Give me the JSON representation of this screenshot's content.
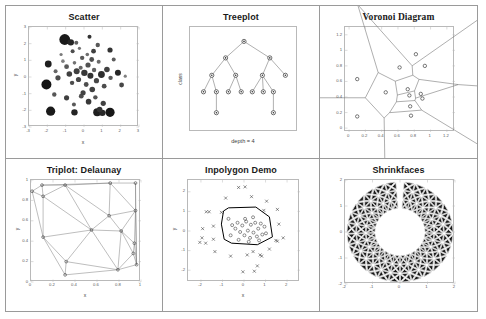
{
  "window": {
    "width": 486,
    "height": 319,
    "background": "#ffffff",
    "frame_color": "#9a9a9a"
  },
  "panels": [
    {
      "id": "scatter",
      "title": "Scatter",
      "title_font": "sans"
    },
    {
      "id": "treeplot",
      "title": "Treeplot",
      "title_font": "sans"
    },
    {
      "id": "voronoi",
      "title": "Voronoi Diagram",
      "title_font": "serif"
    },
    {
      "id": "triplot",
      "title": "Triplot: Delaunay",
      "title_font": "sans"
    },
    {
      "id": "inpolygon",
      "title": "Inpolygon Demo",
      "title_font": "sans"
    },
    {
      "id": "shrinkfaces",
      "title": "Shrinkfaces",
      "title_font": "sans"
    }
  ],
  "chart_data": [
    {
      "type": "scatter",
      "title": "Scatter",
      "xlabel": "x",
      "ylabel": "y",
      "xlim": [
        -3,
        3
      ],
      "ylim": [
        -3,
        3
      ],
      "xticks": [
        -3,
        -2,
        -1,
        0,
        1,
        2,
        3
      ],
      "yticks": [
        -3,
        -2,
        -1,
        0,
        1,
        2,
        3
      ],
      "xticklabels": [
        "-3",
        "-2",
        "-1",
        "0",
        "1",
        "2",
        "3"
      ],
      "yticklabels": [
        "-3",
        "-2",
        "-1",
        "0",
        "1",
        "2",
        "3"
      ],
      "grid": false,
      "marker": "filled-circle",
      "note": "~150 normally distributed points, varying marker size and gray level",
      "points": [
        [
          -1.05,
          2.25,
          5.4,
          0.1
        ],
        [
          -0.72,
          2.08,
          3.2,
          0.15
        ],
        [
          0.3,
          2.42,
          2.0,
          0.2
        ],
        [
          0.75,
          1.92,
          2.2,
          0.35
        ],
        [
          -0.62,
          1.55,
          2.0,
          0.3
        ],
        [
          -0.25,
          1.72,
          1.6,
          0.45
        ],
        [
          0.52,
          1.55,
          2.4,
          0.25
        ],
        [
          1.42,
          1.62,
          2.6,
          0.2
        ],
        [
          -1.95,
          0.78,
          3.4,
          0.12
        ],
        [
          -1.55,
          0.35,
          2.0,
          0.4
        ],
        [
          -2.05,
          -0.45,
          5.0,
          0.08
        ],
        [
          -1.42,
          -0.05,
          2.6,
          0.3
        ],
        [
          -1.15,
          0.95,
          1.8,
          0.5
        ],
        [
          -0.95,
          0.62,
          2.4,
          0.35
        ],
        [
          -0.8,
          0.18,
          2.8,
          0.25
        ],
        [
          -0.65,
          -0.35,
          2.2,
          0.3
        ],
        [
          -0.52,
          0.85,
          1.8,
          0.45
        ],
        [
          -0.4,
          0.35,
          3.0,
          0.25
        ],
        [
          -0.3,
          -0.15,
          2.6,
          0.28
        ],
        [
          -0.18,
          0.55,
          2.0,
          0.4
        ],
        [
          -0.1,
          1.15,
          2.2,
          0.35
        ],
        [
          0.02,
          0.25,
          3.2,
          0.22
        ],
        [
          0.12,
          -0.45,
          2.4,
          0.3
        ],
        [
          0.22,
          0.72,
          2.6,
          0.32
        ],
        [
          0.35,
          0.08,
          3.0,
          0.2
        ],
        [
          0.45,
          -0.75,
          2.8,
          0.25
        ],
        [
          0.55,
          0.42,
          2.2,
          0.38
        ],
        [
          0.68,
          -0.22,
          2.6,
          0.28
        ],
        [
          0.8,
          0.92,
          2.0,
          0.42
        ],
        [
          0.95,
          0.15,
          3.4,
          0.18
        ],
        [
          1.1,
          -0.55,
          2.4,
          0.3
        ],
        [
          1.25,
          0.45,
          2.8,
          0.25
        ],
        [
          1.45,
          -0.05,
          2.2,
          0.35
        ],
        [
          1.85,
          0.25,
          3.0,
          0.15
        ],
        [
          2.25,
          0.05,
          1.6,
          0.5
        ],
        [
          2.05,
          -0.48,
          2.4,
          0.28
        ],
        [
          -0.95,
          -1.25,
          2.6,
          0.25
        ],
        [
          -0.55,
          -1.65,
          2.0,
          0.35
        ],
        [
          -0.15,
          -1.15,
          2.4,
          0.3
        ],
        [
          0.25,
          -1.48,
          2.8,
          0.22
        ],
        [
          0.62,
          -1.22,
          2.2,
          0.33
        ],
        [
          1.05,
          -1.58,
          2.6,
          0.26
        ],
        [
          -1.82,
          -2.05,
          4.6,
          0.1
        ],
        [
          -0.52,
          -2.12,
          3.2,
          0.14
        ],
        [
          0.72,
          -2.12,
          4.0,
          0.12
        ],
        [
          1.0,
          -2.15,
          3.2,
          0.16
        ],
        [
          1.42,
          -2.12,
          4.6,
          0.09
        ],
        [
          0.85,
          -1.95,
          2.8,
          0.2
        ],
        [
          -0.42,
          2.05,
          2.0,
          0.38
        ],
        [
          0.18,
          1.35,
          1.8,
          0.44
        ],
        [
          -1.25,
          1.35,
          1.6,
          0.48
        ],
        [
          1.62,
          1.05,
          2.0,
          0.36
        ],
        [
          -0.05,
          -0.95,
          2.6,
          0.26
        ],
        [
          0.42,
          1.05,
          2.4,
          0.31
        ],
        [
          -1.62,
          -1.05,
          2.2,
          0.34
        ]
      ]
    },
    {
      "type": "tree",
      "title": "Treeplot",
      "xlabel": "depth = 4",
      "ylabel": "class",
      "grid": false,
      "node_marker": "circle-with-dot",
      "nodes": [
        {
          "id": 0,
          "x": 0.5,
          "y": 0.95,
          "parent": null
        },
        {
          "id": 1,
          "x": 0.3,
          "y": 0.76,
          "parent": 0
        },
        {
          "id": 2,
          "x": 0.78,
          "y": 0.76,
          "parent": 0
        },
        {
          "id": 3,
          "x": 0.15,
          "y": 0.56,
          "parent": 1
        },
        {
          "id": 4,
          "x": 0.41,
          "y": 0.56,
          "parent": 1
        },
        {
          "id": 5,
          "x": 0.7,
          "y": 0.56,
          "parent": 2
        },
        {
          "id": 6,
          "x": 0.95,
          "y": 0.56,
          "parent": 2
        },
        {
          "id": 7,
          "x": 0.06,
          "y": 0.37,
          "parent": 3
        },
        {
          "id": 8,
          "x": 0.2,
          "y": 0.37,
          "parent": 3
        },
        {
          "id": 9,
          "x": 0.33,
          "y": 0.37,
          "parent": 4
        },
        {
          "id": 10,
          "x": 0.47,
          "y": 0.37,
          "parent": 4
        },
        {
          "id": 11,
          "x": 0.59,
          "y": 0.37,
          "parent": 5
        },
        {
          "id": 12,
          "x": 0.71,
          "y": 0.37,
          "parent": 5
        },
        {
          "id": 13,
          "x": 0.82,
          "y": 0.37,
          "parent": 5
        },
        {
          "id": 14,
          "x": 0.2,
          "y": 0.13,
          "parent": 8
        },
        {
          "id": 15,
          "x": 0.82,
          "y": 0.13,
          "parent": 13
        }
      ]
    },
    {
      "type": "voronoi",
      "title": "Voronoi Diagram",
      "xlabel": "",
      "ylabel": "",
      "xlim": [
        -0.05,
        1.3
      ],
      "ylim": [
        -0.05,
        1.3
      ],
      "xticks": [
        0,
        0.2,
        0.4,
        0.6,
        0.8,
        1,
        1.2
      ],
      "yticks": [
        0,
        0.2,
        0.4,
        0.6,
        0.8,
        1,
        1.2
      ],
      "xticklabels": [
        "0",
        "0.2",
        "0.4",
        "0.6",
        "0.8",
        "1",
        "1.2"
      ],
      "yticklabels": [
        "0",
        "0.2",
        "0.4",
        "0.6",
        "0.8",
        "1",
        "1.2"
      ],
      "grid": false,
      "sites": [
        [
          0.1,
          0.63
        ],
        [
          0.1,
          0.15
        ],
        [
          0.45,
          0.46
        ],
        [
          0.62,
          0.78
        ],
        [
          0.72,
          0.5
        ],
        [
          0.74,
          0.42
        ],
        [
          0.75,
          0.28
        ],
        [
          0.76,
          0.16
        ],
        [
          0.82,
          0.95
        ],
        [
          0.88,
          0.44
        ],
        [
          0.9,
          0.38
        ],
        [
          0.93,
          0.8
        ]
      ]
    },
    {
      "type": "triplot",
      "title": "Triplot: Delaunay",
      "xlabel": "x",
      "ylabel": "y",
      "xlim": [
        0,
        1
      ],
      "ylim": [
        0,
        1
      ],
      "xticks": [
        0,
        0.2,
        0.4,
        0.6,
        0.8,
        1
      ],
      "yticks": [
        0,
        0.2,
        0.4,
        0.6,
        0.8,
        1
      ],
      "xticklabels": [
        "0",
        "0.2",
        "0.4",
        "0.6",
        "0.8",
        "1"
      ],
      "yticklabels": [
        "0",
        "0.2",
        "0.4",
        "0.6",
        "0.8",
        "1"
      ],
      "grid": false,
      "points": [
        [
          0.01,
          0.89
        ],
        [
          0.1,
          0.95
        ],
        [
          0.11,
          0.84
        ],
        [
          0.31,
          0.95
        ],
        [
          0.32,
          0.2
        ],
        [
          0.31,
          0.07
        ],
        [
          0.11,
          0.44
        ],
        [
          0.55,
          0.51
        ],
        [
          0.72,
          0.97
        ],
        [
          0.71,
          0.65
        ],
        [
          0.79,
          0.12
        ],
        [
          0.82,
          0.5
        ],
        [
          0.93,
          0.28
        ],
        [
          0.94,
          0.38
        ],
        [
          0.95,
          0.97
        ],
        [
          0.95,
          0.7
        ],
        [
          0.96,
          0.17
        ]
      ]
    },
    {
      "type": "inpolygon",
      "title": "Inpolygon Demo",
      "xlabel": "x",
      "ylabel": "y",
      "xlim": [
        -2.6,
        2.6
      ],
      "ylim": [
        -2.6,
        2.6
      ],
      "xticks": [
        -2,
        -1,
        0,
        1,
        2
      ],
      "yticks": [
        -2,
        -1,
        0,
        1,
        2
      ],
      "xticklabels": [
        "-2",
        "-1",
        "0",
        "1",
        "2"
      ],
      "yticklabels": [
        "-2",
        "-1",
        "0",
        "1",
        "2"
      ],
      "grid": false,
      "polygon": [
        [
          -0.95,
          1.02
        ],
        [
          -0.72,
          1.18
        ],
        [
          0.55,
          1.22
        ],
        [
          1.18,
          0.72
        ],
        [
          1.32,
          -0.3
        ],
        [
          0.62,
          -0.7
        ],
        [
          -0.58,
          -0.62
        ],
        [
          -0.92,
          -0.42
        ],
        [
          -1.05,
          0.35
        ]
      ],
      "inside_marker": "circle",
      "outside_marker": "x",
      "inside_points": [
        [
          -0.55,
          0.3
        ],
        [
          -0.4,
          0.12
        ],
        [
          -0.3,
          0.42
        ],
        [
          -0.18,
          -0.05
        ],
        [
          -0.08,
          0.28
        ],
        [
          0.02,
          -0.22
        ],
        [
          0.1,
          0.48
        ],
        [
          0.18,
          0.02
        ],
        [
          0.28,
          -0.35
        ],
        [
          0.32,
          0.32
        ],
        [
          0.44,
          -0.08
        ],
        [
          0.52,
          0.42
        ],
        [
          0.6,
          -0.28
        ],
        [
          0.66,
          0.12
        ],
        [
          0.78,
          0.38
        ],
        [
          0.85,
          -0.18
        ],
        [
          0.95,
          0.22
        ],
        [
          -0.62,
          -0.22
        ],
        [
          -0.25,
          -0.45
        ],
        [
          0.05,
          0.62
        ],
        [
          0.42,
          0.7
        ],
        [
          -0.72,
          0.62
        ],
        [
          0.22,
          -0.55
        ],
        [
          0.7,
          -0.48
        ],
        [
          1.02,
          -0.12
        ]
      ],
      "outside_points": [
        [
          -0.25,
          2.22
        ],
        [
          0.05,
          2.25
        ],
        [
          0.35,
          1.75
        ],
        [
          1.05,
          1.52
        ],
        [
          1.55,
          1.1
        ],
        [
          -1.75,
          0.98
        ],
        [
          -1.62,
          0.98
        ],
        [
          -1.92,
          0.12
        ],
        [
          -2.05,
          -0.58
        ],
        [
          -1.78,
          -0.62
        ],
        [
          -1.42,
          -0.42
        ],
        [
          -1.35,
          -1.05
        ],
        [
          -0.62,
          -1.28
        ],
        [
          0.15,
          -1.22
        ],
        [
          0.42,
          -1.05
        ],
        [
          0.75,
          -1.22
        ],
        [
          0.82,
          -1.28
        ],
        [
          1.18,
          -0.92
        ],
        [
          1.55,
          -0.52
        ],
        [
          1.82,
          -0.35
        ],
        [
          1.48,
          -0.48
        ],
        [
          0.62,
          -1.78
        ],
        [
          -0.05,
          -2.08
        ],
        [
          0.48,
          -2.05
        ],
        [
          -1.95,
          -0.35
        ],
        [
          -1.42,
          0.25
        ],
        [
          1.62,
          0.35
        ],
        [
          -0.85,
          1.68
        ],
        [
          0.92,
          1.05
        ],
        [
          -1.05,
          0.95
        ]
      ]
    },
    {
      "type": "shrinkfaces",
      "title": "Shrinkfaces",
      "xlabel": "",
      "ylabel": "",
      "xlim": [
        -2,
        2
      ],
      "ylim": [
        -2,
        2
      ],
      "xticks": [
        -2,
        -1,
        0,
        1,
        2
      ],
      "yticks": [
        -2,
        -1,
        0,
        1,
        2
      ],
      "xticklabels": [
        "-2",
        "-1",
        "0",
        "1",
        "2"
      ],
      "yticklabels": [
        "-2",
        "-1",
        "0",
        "1",
        "2"
      ],
      "grid": false,
      "shape": "annulus",
      "inner_radius": 0.9,
      "outer_radius": 1.95,
      "gap_start_deg": 86,
      "gap_end_deg": 94,
      "radial_divisions": 3,
      "angular_divisions": 28,
      "face_color": "#1a1a1a",
      "edge_color": "#d8d8d8",
      "shrink_factor": 0.72
    }
  ]
}
